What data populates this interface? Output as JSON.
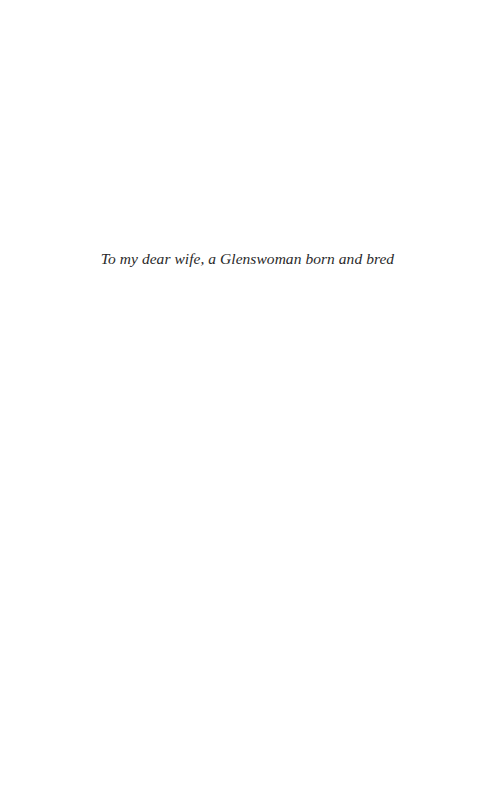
{
  "page": {
    "background": "#ffffff",
    "text_color": "#2a2a2a"
  },
  "dedication": {
    "text": "To my dear wife, a Glenswoman born and bred"
  }
}
